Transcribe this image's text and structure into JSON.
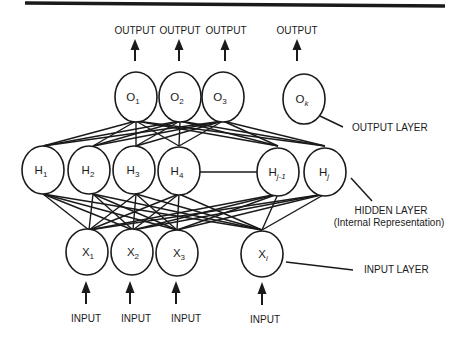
{
  "diagram": {
    "colors": {
      "ink": "#1a1a1a",
      "background": "#ffffff"
    },
    "output_layer": {
      "label": "OUTPUT LAYER",
      "nodes": [
        {
          "id": "O1",
          "base": "O",
          "sub": "1",
          "output_label": "OUTPUT"
        },
        {
          "id": "O2",
          "base": "O",
          "sub": "2",
          "output_label": "OUTPUT"
        },
        {
          "id": "O3",
          "base": "O",
          "sub": "3",
          "output_label": "OUTPUT"
        },
        {
          "id": "Ok",
          "base": "O",
          "sub": "k",
          "output_label": "OUTPUT"
        }
      ]
    },
    "hidden_layer": {
      "label": "HIDDEN LAYER",
      "sublabel": "(Internal Representation)",
      "nodes": [
        {
          "id": "H1",
          "base": "H",
          "sub": "1"
        },
        {
          "id": "H2",
          "base": "H",
          "sub": "2"
        },
        {
          "id": "H3",
          "base": "H",
          "sub": "3"
        },
        {
          "id": "H4",
          "base": "H",
          "sub": "4"
        },
        {
          "id": "Hj-1",
          "base": "H",
          "sub": "j-1"
        },
        {
          "id": "Hj",
          "base": "H",
          "sub": "j"
        }
      ]
    },
    "input_layer": {
      "label": "INPUT LAYER",
      "nodes": [
        {
          "id": "X1",
          "base": "X",
          "sub": "1",
          "input_label": "INPUT"
        },
        {
          "id": "X2",
          "base": "X",
          "sub": "2",
          "input_label": "INPUT"
        },
        {
          "id": "X3",
          "base": "X",
          "sub": "3",
          "input_label": "INPUT"
        },
        {
          "id": "Xi",
          "base": "X",
          "sub": "i",
          "input_label": "INPUT"
        }
      ]
    }
  }
}
